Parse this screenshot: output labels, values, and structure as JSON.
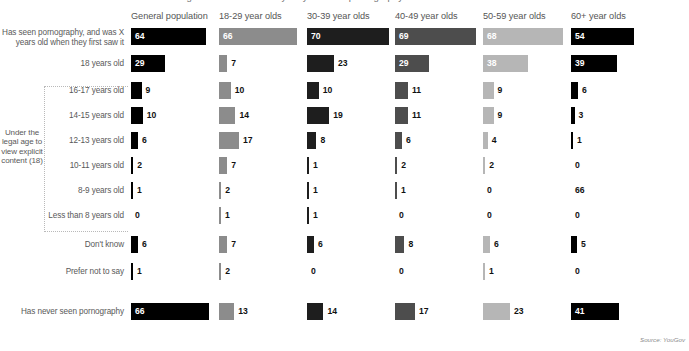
{
  "title_partial": "Age at which Britons say they first saw pornography",
  "source": "Source: YouGov",
  "bracket": {
    "label": "Under the legal age to view explicit content (18)"
  },
  "columns": [
    {
      "label": "General population",
      "color": "#000000",
      "x": 131
    },
    {
      "label": "18-29 year olds",
      "color": "#8c8c8c",
      "x": 219
    },
    {
      "label": "30-39 year olds",
      "color": "#1e1e1e",
      "x": 307
    },
    {
      "label": "40-49 year olds",
      "color": "#4d4d4d",
      "x": 395
    },
    {
      "label": "50-59 year olds",
      "color": "#b6b6b6",
      "x": 483
    },
    {
      "label": "60+ year olds",
      "color": "#000000",
      "x": 571
    }
  ],
  "rows": [
    {
      "label": "Has seen pornography, and was X years old when they first saw it",
      "y": 28,
      "group": "top"
    },
    {
      "label": "18 years old",
      "y": 55,
      "group": "top"
    },
    {
      "label": "16-17 years old",
      "y": 82,
      "group": "under"
    },
    {
      "label": "14-15 years old",
      "y": 107,
      "group": "under"
    },
    {
      "label": "12-13 years old",
      "y": 132,
      "group": "under"
    },
    {
      "label": "10-11 years old",
      "y": 157,
      "group": "under"
    },
    {
      "label": "8-9 years old",
      "y": 182,
      "group": "under"
    },
    {
      "label": "Less than 8 years old",
      "y": 207,
      "group": "under"
    },
    {
      "label": "Don't know",
      "y": 236,
      "group": "other"
    },
    {
      "label": "Prefer not to say",
      "y": 263,
      "group": "other"
    },
    {
      "label": "Has never seen pornography",
      "y": 303,
      "group": "never"
    }
  ],
  "chart_data": {
    "type": "bar",
    "title": "Age at which Britons say they first saw pornography",
    "xlabel": "",
    "ylabel": "",
    "grid": false,
    "legend": "none",
    "units": "percent",
    "categories": [
      "Has seen pornography, and was X years old when they first saw it",
      "18 years old",
      "16-17 years old",
      "14-15 years old",
      "12-13 years old",
      "10-11 years old",
      "8-9 years old",
      "Less than 8 years old",
      "Don't know",
      "Prefer not to say",
      "Has never seen pornography"
    ],
    "series": [
      {
        "name": "General population",
        "values": [
          64,
          29,
          9,
          10,
          6,
          2,
          1,
          0,
          6,
          1,
          66
        ]
      },
      {
        "name": "18-29 year olds",
        "values": [
          66,
          7,
          10,
          14,
          17,
          7,
          2,
          1,
          7,
          2,
          13
        ]
      },
      {
        "name": "30-39 year olds",
        "values": [
          70,
          23,
          10,
          19,
          8,
          1,
          1,
          1,
          6,
          0,
          14
        ]
      },
      {
        "name": "40-49 year olds",
        "values": [
          69,
          29,
          11,
          11,
          6,
          2,
          1,
          0,
          8,
          0,
          17
        ]
      },
      {
        "name": "50-59 year olds",
        "values": [
          68,
          38,
          9,
          9,
          4,
          2,
          0,
          0,
          6,
          1,
          23
        ]
      },
      {
        "name": "60+ year olds",
        "values": [
          54,
          39,
          6,
          3,
          1,
          0,
          66,
          0,
          5,
          0,
          41
        ]
      }
    ],
    "value_labels": [
      [
        "64",
        "29",
        "9",
        "10",
        "6",
        "2",
        "1",
        "0",
        "6",
        "1",
        "66"
      ],
      [
        "66",
        "7",
        "10",
        "14",
        "17",
        "7",
        "2",
        "1",
        "7",
        "2",
        "13"
      ],
      [
        "70",
        "23",
        "10",
        "19",
        "8",
        "1",
        "1",
        "1",
        "6",
        "0",
        "14"
      ],
      [
        "69",
        "29",
        "11",
        "11",
        "6",
        "2",
        "1",
        "0",
        "8",
        "0",
        "17"
      ],
      [
        "68",
        "38",
        "9",
        "9",
        "4",
        "2",
        "0",
        "0",
        "6",
        "1",
        "23"
      ],
      [
        "54",
        "39",
        "6",
        "3",
        "1",
        "0",
        "66",
        "0",
        "5",
        "0",
        "41"
      ]
    ]
  }
}
